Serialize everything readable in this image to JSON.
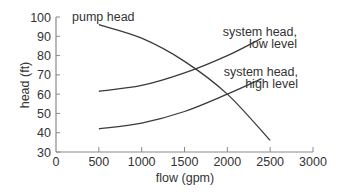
{
  "chart_data": {
    "type": "line",
    "title": "",
    "xlabel": "flow (gpm)",
    "ylabel": "head (ft)",
    "xlim": [
      0,
      3000
    ],
    "ylim": [
      30,
      100
    ],
    "x_ticks": [
      0,
      500,
      1000,
      1500,
      2000,
      2500,
      3000
    ],
    "y_ticks": [
      30,
      40,
      50,
      60,
      70,
      80,
      90,
      100
    ],
    "grid": false,
    "legend": "inline labels",
    "series": [
      {
        "name": "pump head",
        "x": [
          500,
          1000,
          1500,
          2000,
          2500
        ],
        "y": [
          96,
          89,
          77,
          60,
          36
        ]
      },
      {
        "name": "system head, low level",
        "x": [
          500,
          1000,
          1500,
          2000,
          2400
        ],
        "y": [
          61.5,
          64.5,
          71,
          80,
          89
        ]
      },
      {
        "name": "system head, high level",
        "x": [
          500,
          1000,
          1500,
          2000,
          2400
        ],
        "y": [
          42,
          45,
          51,
          60,
          68
        ]
      }
    ],
    "annotations": [
      {
        "text": "pump head"
      },
      {
        "text": "system head,",
        "text2": "low level"
      },
      {
        "text": "system head,",
        "text2": "high level"
      }
    ]
  },
  "labels": {
    "pump": "pump head",
    "low_1": "system head,",
    "low_2": "low level",
    "high_1": "system head,",
    "high_2": "high level",
    "xlabel": "flow (gpm)",
    "ylabel": "head (ft)"
  },
  "colors": {
    "axis": "#8a8a8a",
    "line": "#3a3a3a",
    "text": "#333333"
  }
}
